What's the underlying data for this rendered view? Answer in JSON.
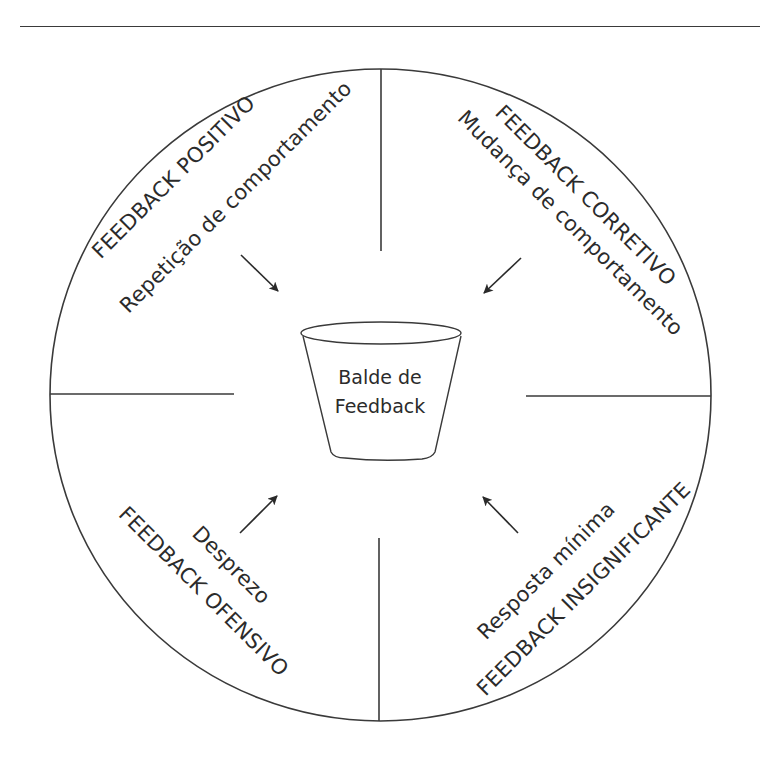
{
  "diagram": {
    "center": {
      "label_line1": "Balde de",
      "label_line2": "Feedback",
      "icon": "bucket-icon"
    },
    "quadrants": [
      {
        "id": "top-left",
        "title": "FEEDBACK POSITIVO",
        "subtitle": "Repetição de comportamento",
        "arrow": "arrow-toward-center"
      },
      {
        "id": "top-right",
        "title": "FEEDBACK CORRETIVO",
        "subtitle": "Mudança de comportamento",
        "arrow": "arrow-toward-center"
      },
      {
        "id": "bottom-left",
        "title": "FEEDBACK OFENSIVO",
        "subtitle": "Desprezo",
        "arrow": "arrow-toward-center"
      },
      {
        "id": "bottom-right",
        "title": "FEEDBACK INSIGNIFICANTE",
        "subtitle": "Resposta mínima",
        "arrow": "arrow-toward-center"
      }
    ],
    "colors": {
      "line": "#3a3a3a",
      "text": "#2b2b2b",
      "background": "#ffffff"
    }
  }
}
